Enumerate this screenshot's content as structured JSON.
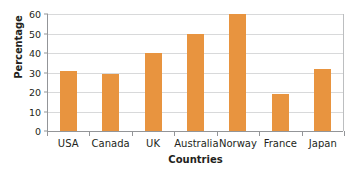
{
  "chart_data": {
    "type": "bar",
    "title": "",
    "subtitle": "",
    "xlabel": "Countries",
    "ylabel": "Percentage",
    "categories": [
      "USA",
      "Canada",
      "UK",
      "Australia",
      "Norway",
      "France",
      "Japan"
    ],
    "values": [
      31,
      29,
      40,
      50,
      60,
      19,
      32
    ],
    "ylim": [
      0,
      60
    ],
    "yticks": [
      0,
      10,
      20,
      30,
      40,
      50,
      60
    ],
    "ytick_labels": [
      "0",
      "10",
      "20",
      "30",
      "40",
      "50",
      "60"
    ],
    "grid": "horizontal",
    "legend": "none",
    "bar_color": "#e8943f",
    "axis_color": "#939598",
    "grid_color": "#d8d9da",
    "text_color": "#231f20",
    "background": "#ffffff"
  }
}
